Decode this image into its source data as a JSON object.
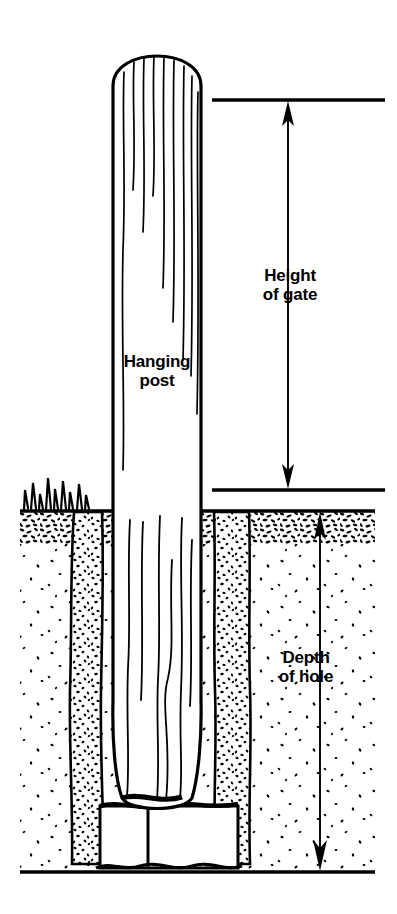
{
  "figure": {
    "type": "technical-line-illustration",
    "background_color": "#ffffff",
    "ink_color": "#000000"
  },
  "labels": {
    "post": "Hanging\npost",
    "height_of_gate": "Height\nof gate",
    "depth_of_hole": "Depth\nof hole"
  },
  "dimensions": {
    "height_of_gate": {
      "label": "Height of gate",
      "top_reference_y": 100,
      "bottom_reference_y": 490,
      "arrow_x": 288,
      "arrowheads": "both",
      "top_tick_line": {
        "x1": 212,
        "x2": 385,
        "y": 100
      },
      "bottom_tick_line": {
        "x1": 212,
        "x2": 385,
        "y": 490
      }
    },
    "depth_of_hole": {
      "label": "Depth of hole",
      "top_reference_y": 512,
      "bottom_reference_y": 872,
      "arrow_x": 320,
      "arrowheads": "both"
    }
  },
  "geometry": {
    "post": {
      "name": "hanging-post",
      "left_x": 113,
      "right_x": 201,
      "top_y": 40,
      "rounded_top": true,
      "buried_bottom_y": 805,
      "grain_lines": 9
    },
    "ground_surface_y": 510,
    "topsoil_band": {
      "top_y": 510,
      "bottom_y": 542
    },
    "baseline_y": 872,
    "hole": {
      "left_wall_x": 70,
      "right_wall_x": 250,
      "bottom_y": 870,
      "backfill": "stippled-rubble"
    },
    "stone_base": {
      "top_y": 805,
      "bottom_y": 870,
      "left_x": 82,
      "right_x": 238,
      "blocks": 2
    },
    "grass_tuft": {
      "x_start": 20,
      "x_end": 92,
      "y": 510
    }
  }
}
